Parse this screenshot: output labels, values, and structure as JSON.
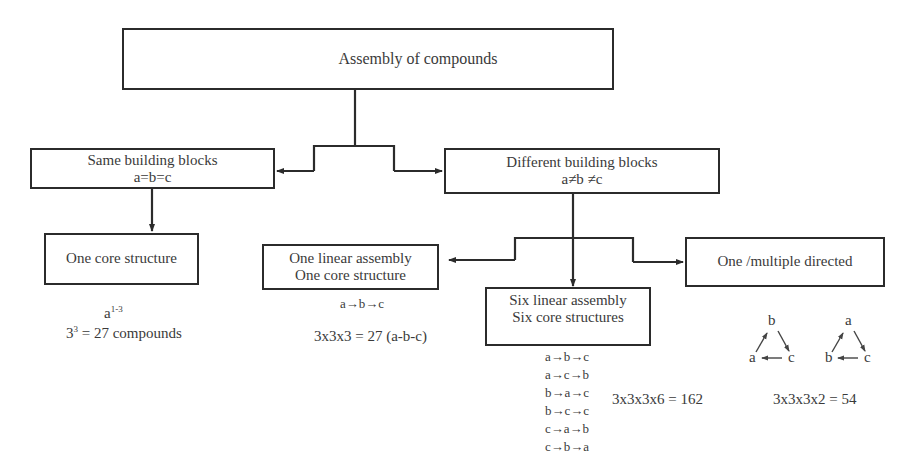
{
  "diagram": {
    "root": {
      "label": "Assembly of compounds"
    },
    "level1": [
      {
        "id": "same",
        "title": "Same building blocks",
        "condition": "a=b=c"
      },
      {
        "id": "different",
        "title": "Different building blocks",
        "condition": "a≠b ≠c"
      }
    ],
    "level2": {
      "same_child": {
        "label": "One core structure"
      },
      "different_children": [
        {
          "id": "one-linear",
          "line1": "One linear assembly",
          "line2": "One core structure"
        },
        {
          "id": "six-linear",
          "line1": "Six linear assembly",
          "line2": "Six core structures"
        },
        {
          "id": "directed",
          "line1": "One /multiple directed"
        }
      ]
    },
    "annotations": {
      "same": {
        "formula_base": "a",
        "formula_exp": "1-3",
        "count_base": "3",
        "count_exp": "3",
        "count_rest": " = 27 compounds"
      },
      "one_linear": {
        "sequence": "a→b→c",
        "count": "3x3x3 = 27 (a-b-c)"
      },
      "six_linear": {
        "sequences": [
          "a→b→c",
          "a→c→b",
          "b→a→c",
          "b→c→c",
          "c→a→b",
          "c→b→a"
        ],
        "count": "3x3x3x6 = 162"
      },
      "directed": {
        "cycles": [
          {
            "top": "b",
            "left": "a",
            "right": "c"
          },
          {
            "top": "a",
            "left": "b",
            "right": "c"
          }
        ],
        "count": "3x3x3x2 = 54"
      }
    },
    "colors": {
      "line": "#2b2b2b",
      "text": "#3a3a3a",
      "background": "#ffffff"
    }
  }
}
